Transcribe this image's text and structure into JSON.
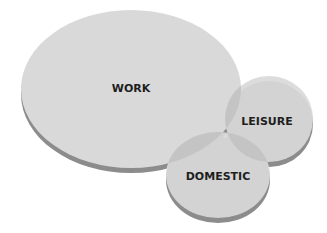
{
  "diagram": {
    "type": "venn",
    "colors": {
      "fill": "#d9d9d9",
      "edge": "#8c8c8c",
      "overlap": "#c4c4c4",
      "text": "#1e1e1e"
    },
    "sets": [
      {
        "id": "work",
        "label": "WORK"
      },
      {
        "id": "leisure",
        "label": "LEISURE"
      },
      {
        "id": "domestic",
        "label": "DOMESTIC"
      }
    ]
  }
}
